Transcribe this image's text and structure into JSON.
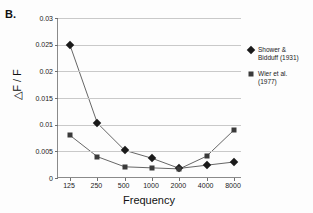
{
  "panel": {
    "label": "B."
  },
  "chart_data": {
    "type": "line",
    "title": "",
    "xlabel": "Frequency",
    "ylabel": "△F / F",
    "categories": [
      "125",
      "250",
      "500",
      "1000",
      "2000",
      "4000",
      "8000"
    ],
    "x": [
      125,
      250,
      500,
      1000,
      2000,
      4000,
      8000
    ],
    "xscale": "log2-categorical",
    "ylim": [
      0,
      0.03
    ],
    "yticks": [
      "0",
      "0.005",
      "0.01",
      "0.015",
      "0.02",
      "0.025",
      "0.03"
    ],
    "ytick_values": [
      0,
      0.005,
      0.01,
      0.015,
      0.02,
      0.025,
      0.03
    ],
    "grid": "horizontal",
    "legend_position": "right",
    "series": [
      {
        "name": "Shower & Bidduff (1931)",
        "marker": "diamond",
        "color": "#1a1a1a",
        "values": [
          0.0249,
          0.0103,
          0.0052,
          0.0037,
          0.0018,
          0.0024,
          0.003
        ]
      },
      {
        "name": "Wier et al. (1977)",
        "marker": "square",
        "color": "#3a3a3a",
        "values": [
          0.008,
          0.004,
          0.0021,
          0.0019,
          0.0017,
          0.0041,
          0.009
        ]
      }
    ]
  },
  "legend": {
    "entries": [
      {
        "line1": "Shower &",
        "line2": "Bidduff (1931)"
      },
      {
        "line1": "Wier et al.",
        "line2": "(1977)"
      }
    ]
  }
}
